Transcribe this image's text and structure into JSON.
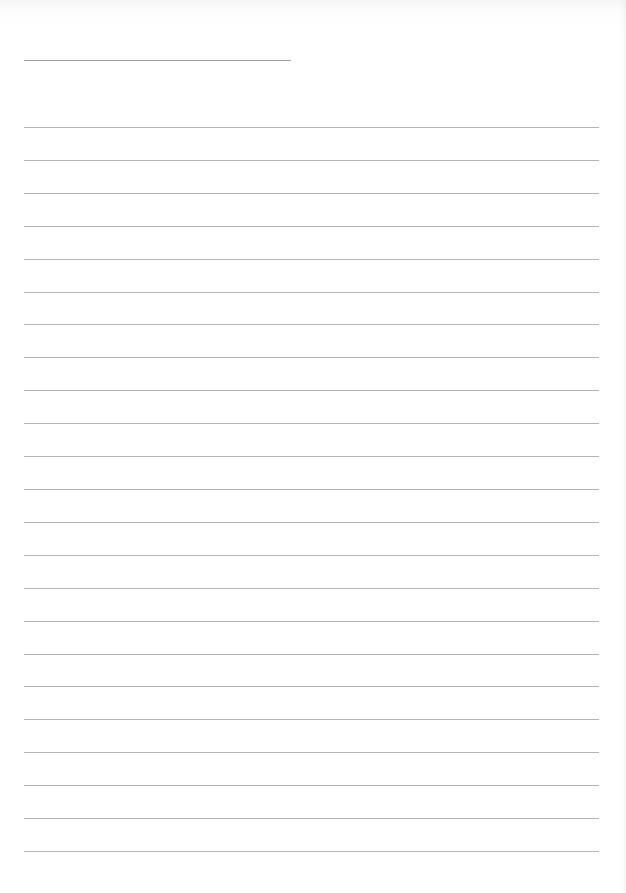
{
  "document": {
    "type": "lined-writing-sheet",
    "header": {
      "has_title_line": true,
      "title_text": ""
    },
    "ruled_lines": {
      "count": 23,
      "content": [
        "",
        "",
        "",
        "",
        "",
        "",
        "",
        "",
        "",
        "",
        "",
        "",
        "",
        "",
        "",
        "",
        "",
        "",
        "",
        "",
        "",
        "",
        ""
      ]
    },
    "colors": {
      "paper": "#ffffff",
      "header_line": "#9e9e9e",
      "rule_line": "#b4b4b4"
    }
  }
}
